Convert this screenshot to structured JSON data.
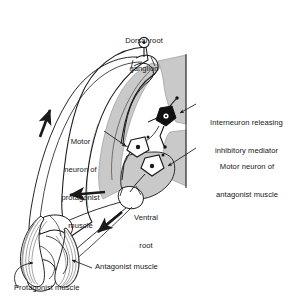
{
  "figure": {
    "type": "anatomical-diagram",
    "colors": {
      "background": "#ffffff",
      "gray_matter": "#c9c9c9",
      "gray_matter_dark": "#b4b4b4",
      "outline": "#1a1a1a",
      "interneuron_fill": "#111111",
      "motor_neuron_fill": "#ffffff",
      "text": "#161616"
    }
  },
  "labels": {
    "dorsal_root_ganglion": {
      "line1": "Dorsal root",
      "line2": "ganglion"
    },
    "interneuron": {
      "line1": "Interneuron releasing",
      "line2": "inhibitory mediator"
    },
    "motor_neuron_antagonist": {
      "line1": "Motor neuron of",
      "line2": "antagonist muscle"
    },
    "motor_neuron_protagonist": {
      "line1": "Motor",
      "line2": "neuron of",
      "line3": "protagonist",
      "line4": "muscle"
    },
    "ventral_root": {
      "line1": "Ventral",
      "line2": "root"
    },
    "antagonist_muscle": "Antagonist muscle",
    "protagonist_muscle": "Protagonist muscle"
  },
  "structures": [
    {
      "name": "dorsal-root-ganglion",
      "kind": "ganglion"
    },
    {
      "name": "dorsal-root",
      "kind": "nerve-root"
    },
    {
      "name": "ventral-root",
      "kind": "nerve-root"
    },
    {
      "name": "spinal-cord-gray-matter",
      "kind": "gray-matter"
    },
    {
      "name": "interneuron-cell-body",
      "kind": "neuron",
      "fill": "dark"
    },
    {
      "name": "motor-neuron-protagonist-cell-body",
      "kind": "neuron",
      "fill": "light"
    },
    {
      "name": "motor-neuron-antagonist-cell-body",
      "kind": "neuron",
      "fill": "light"
    },
    {
      "name": "protagonist-muscle",
      "kind": "muscle"
    },
    {
      "name": "antagonist-muscle",
      "kind": "muscle"
    },
    {
      "name": "limb-joint",
      "kind": "bone"
    }
  ],
  "flow_arrows": [
    {
      "name": "afferent-arrow",
      "direction": "toward-cord",
      "description": "sensory signal travelling up to spinal cord"
    },
    {
      "name": "efferent-arrow-protagonist",
      "direction": "toward-muscle",
      "description": "motor signal travelling to protagonist muscle"
    },
    {
      "name": "efferent-arrow-antagonist",
      "direction": "toward-muscle",
      "description": "motor signal travelling to antagonist muscle"
    }
  ]
}
